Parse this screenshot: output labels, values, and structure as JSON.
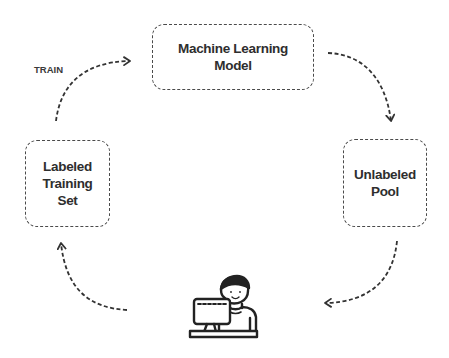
{
  "diagram": {
    "nodes": [
      {
        "id": "ml-model",
        "lines": [
          "Machine Learning",
          "Model"
        ]
      },
      {
        "id": "unlabeled-pool",
        "lines": [
          "Unlabeled",
          "Pool"
        ]
      },
      {
        "id": "annotator",
        "icon": "person-at-computer-icon"
      },
      {
        "id": "labeled-set",
        "lines": [
          "Labeled",
          "Training",
          "Set"
        ]
      }
    ],
    "edges": [
      {
        "from": "labeled-set",
        "to": "ml-model",
        "label": "TRAIN"
      },
      {
        "from": "ml-model",
        "to": "unlabeled-pool",
        "label": ""
      },
      {
        "from": "unlabeled-pool",
        "to": "annotator",
        "label": ""
      },
      {
        "from": "annotator",
        "to": "labeled-set",
        "label": ""
      }
    ],
    "stroke_color": "#3a3a3a",
    "background": "#ffffff"
  }
}
